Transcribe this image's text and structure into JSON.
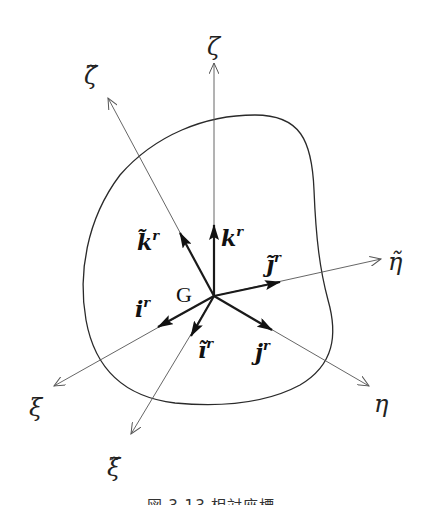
{
  "figure": {
    "origin_label": "G",
    "axes": {
      "zeta": {
        "label": "ζ"
      },
      "zeta_tilde": {
        "label": "ζ̃"
      },
      "eta": {
        "label": "η"
      },
      "eta_tilde": {
        "label": "η̃"
      },
      "xi": {
        "label": "ξ"
      },
      "xi_tilde": {
        "label": "ξ̃"
      }
    },
    "vectors": {
      "k": {
        "base": "k",
        "sup": "r"
      },
      "k_tilde": {
        "base": "k̃",
        "sup": "r"
      },
      "j": {
        "base": "j",
        "sup": "r"
      },
      "j_tilde": {
        "base": "j̃",
        "sup": "r"
      },
      "i": {
        "base": "i",
        "sup": "r"
      },
      "i_tilde": {
        "base": "ĩ",
        "sup": "r"
      }
    }
  },
  "caption": "図 3.13 相対座標"
}
